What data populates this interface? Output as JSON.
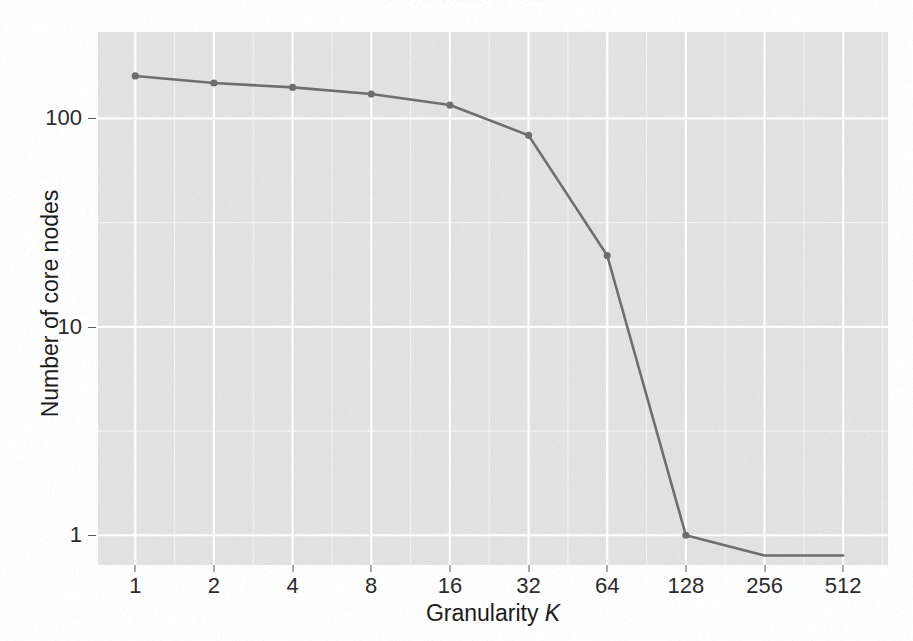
{
  "figure": {
    "cropped_caption_text": "· · · · · · · · · · · · · · · · · · · ·",
    "panel_background": "#e2e2e2",
    "gridline_color": "#ffffff",
    "series_color": "#6e6e6e"
  },
  "axes": {
    "x_title_main": "Granularity ",
    "x_title_symbol": "K",
    "y_title": "Number of core nodes",
    "x_tick_labels": [
      "1",
      "2",
      "4",
      "8",
      "16",
      "32",
      "64",
      "128",
      "256",
      "512"
    ],
    "y_tick_labels": [
      "1",
      "10",
      "100"
    ]
  },
  "chart_data": {
    "type": "line",
    "title": "",
    "subtitle": "",
    "xlabel": "Granularity K",
    "ylabel": "Number of core nodes",
    "x_scale": "log2",
    "y_scale": "log10",
    "x": [
      1,
      2,
      4,
      8,
      16,
      32,
      64,
      128,
      256,
      512
    ],
    "xticks": [
      1,
      2,
      4,
      8,
      16,
      32,
      64,
      128,
      256,
      512
    ],
    "xticklabels": [
      "1",
      "2",
      "4",
      "8",
      "16",
      "32",
      "64",
      "128",
      "256",
      "512"
    ],
    "yticks": [
      1,
      10,
      100
    ],
    "yticklabels": [
      "1",
      "10",
      "100"
    ],
    "xlim": [
      0.72,
      760
    ],
    "ylim": [
      0.72,
      260
    ],
    "grid": true,
    "legend": false,
    "markers": true,
    "series": [
      {
        "name": "Number of core nodes",
        "values": [
          160,
          148,
          141,
          131,
          116,
          83,
          22,
          1,
          0.8,
          0.8
        ],
        "color": "#6e6e6e",
        "marker_x": [
          1,
          2,
          4,
          8,
          16,
          32,
          64,
          128
        ],
        "marker_values": [
          160,
          148,
          141,
          131,
          116,
          83,
          22,
          1
        ]
      }
    ]
  }
}
